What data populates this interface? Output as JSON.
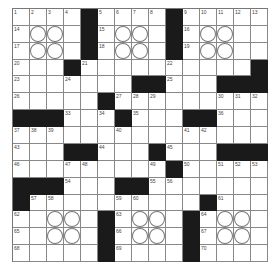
{
  "puzzle": {
    "size": {
      "rows": 15,
      "cols": 15
    },
    "colors": {
      "black": "#1a1a1a",
      "line": "#888888",
      "background": "#ffffff"
    },
    "grid": [
      [
        "1",
        "2",
        "3",
        "4",
        "#",
        "5",
        "6",
        "7",
        "8",
        "#",
        "9",
        "10",
        "11",
        "12",
        "13"
      ],
      [
        "14",
        "",
        "",
        "",
        "#",
        "15",
        "",
        "",
        "",
        "#",
        "16",
        "",
        "",
        "",
        ""
      ],
      [
        "17",
        "",
        "",
        "",
        "#",
        "18",
        "",
        "",
        "",
        "#",
        "19",
        "",
        "",
        "",
        ""
      ],
      [
        "20",
        "",
        "",
        "#",
        "21",
        "",
        "",
        "",
        "",
        "22",
        "",
        "",
        "",
        "",
        "#"
      ],
      [
        "23",
        "",
        "",
        "24",
        "",
        "",
        "",
        "#",
        "#",
        "25",
        "",
        "",
        "#",
        "#",
        "#"
      ],
      [
        "26",
        "",
        "",
        "",
        "",
        "#",
        "27",
        "28",
        "29",
        "",
        "",
        "",
        "30",
        "31",
        "32"
      ],
      [
        "#",
        "#",
        "#",
        "33",
        "",
        "34",
        "#",
        "35",
        "",
        "",
        "#",
        "#",
        "36",
        "",
        ""
      ],
      [
        "37",
        "38",
        "39",
        "",
        "",
        "",
        "40",
        "",
        "",
        "",
        "41",
        "42",
        "",
        "",
        ""
      ],
      [
        "43",
        "",
        "",
        "#",
        "#",
        "44",
        "",
        "",
        "#",
        "45",
        "",
        "",
        "#",
        "#",
        "#"
      ],
      [
        "46",
        "",
        "",
        "47",
        "48",
        "",
        "",
        "",
        "49",
        "#",
        "50",
        "",
        "51",
        "52",
        "53"
      ],
      [
        "#",
        "#",
        "#",
        "54",
        "",
        "",
        "#",
        "#",
        "55",
        "56",
        "",
        "",
        "",
        "",
        ""
      ],
      [
        "#",
        "57",
        "58",
        "",
        "",
        "",
        "59",
        "60",
        "",
        "",
        "",
        "#",
        "61",
        "",
        ""
      ],
      [
        "62",
        "",
        "",
        "",
        "",
        "#",
        "63",
        "",
        "",
        "",
        "#",
        "64",
        "",
        "",
        ""
      ],
      [
        "65",
        "",
        "",
        "",
        "",
        "#",
        "66",
        "",
        "",
        "",
        "#",
        "67",
        "",
        "",
        ""
      ],
      [
        "68",
        "",
        "",
        "",
        "",
        "#",
        "69",
        "",
        "",
        "",
        "#",
        "70",
        "",
        "",
        ""
      ]
    ],
    "circles": [
      [
        1,
        1
      ],
      [
        1,
        2
      ],
      [
        1,
        6
      ],
      [
        1,
        7
      ],
      [
        1,
        11
      ],
      [
        1,
        12
      ],
      [
        2,
        1
      ],
      [
        2,
        2
      ],
      [
        2,
        6
      ],
      [
        2,
        7
      ],
      [
        2,
        11
      ],
      [
        2,
        12
      ],
      [
        12,
        2
      ],
      [
        12,
        3
      ],
      [
        12,
        7
      ],
      [
        12,
        8
      ],
      [
        12,
        12
      ],
      [
        12,
        13
      ],
      [
        13,
        2
      ],
      [
        13,
        3
      ],
      [
        13,
        7
      ],
      [
        13,
        8
      ],
      [
        13,
        12
      ],
      [
        13,
        13
      ]
    ]
  }
}
